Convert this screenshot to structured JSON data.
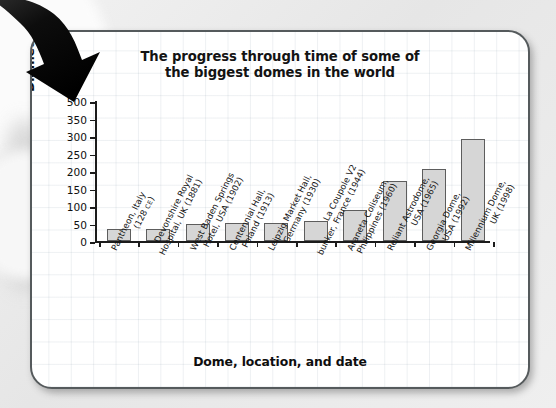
{
  "chart_data": {
    "type": "bar",
    "title": "The progress through time of some of the biggest domes in the world",
    "title_line1": "The progress through time of some of",
    "title_line2": "the biggest domes in the world",
    "xlabel": "Dome, location, and date",
    "ylabel": "Diameter (m)",
    "ytick_labels": [
      "500",
      "350",
      "300",
      "250",
      "200",
      "150",
      "100",
      "50",
      "0"
    ],
    "ylim": [
      0,
      500
    ],
    "grid": true,
    "legend": "none",
    "bar_fill": "#d6d6d6",
    "bar_edge": "#5d5d5d",
    "categories": [
      "Pantheon, Italy (128 CE)",
      "Devonshire Royal Hospital, UK (1881)",
      "West Baden Springs Hotel, USA (1902)",
      "Centennial Hall, Poland (1913)",
      "Leipzig Market Hall, Germany (1930)",
      "La Coupole V2 bunker, France (1944)",
      "Araneta Coliseum, Philippines (1960)",
      "Reliant Astrodome, USA (1965)",
      "Georgia Dome, USA (1992)",
      "Millennium Dome, UK (1998)"
    ],
    "category_lines": [
      {
        "l1": "Pantheon, Italy",
        "l2": "(128 ",
        "sc": "CE",
        "l2b": ")"
      },
      {
        "l1": "Devonshire Royal",
        "l2": "Hospital, UK (1881)",
        "sc": "",
        "l2b": ""
      },
      {
        "l1": "West Baden Springs",
        "l2": "Hotel, USA (1902)",
        "sc": "",
        "l2b": ""
      },
      {
        "l1": "Centennial Hall,",
        "l2": "Poland (1913)",
        "sc": "",
        "l2b": ""
      },
      {
        "l1": "Leipzig Market Hall,",
        "l2": "Germany (1930)",
        "sc": "",
        "l2b": ""
      },
      {
        "l1": "La Coupole V2",
        "l2": "bunker, France (1944)",
        "sc": "",
        "l2b": ""
      },
      {
        "l1": "Araneta Coliseum,",
        "l2": "Philippines (1960)",
        "sc": "",
        "l2b": ""
      },
      {
        "l1": "Reliant Astrodome,",
        "l2": "USA (1965)",
        "sc": "",
        "l2b": ""
      },
      {
        "l1": "Georgia Dome,",
        "l2": "USA (1992)",
        "sc": "",
        "l2b": ""
      },
      {
        "l1": "Millennium Dome,",
        "l2": "UK (1998)",
        "sc": "",
        "l2b": ""
      }
    ],
    "values": [
      43,
      44,
      60,
      65,
      66,
      72,
      110,
      216,
      256,
      365
    ]
  },
  "decor": {
    "arrow": "curved-down-right-arrow"
  }
}
